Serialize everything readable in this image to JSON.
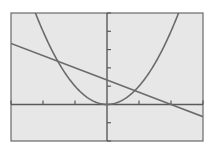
{
  "chart_data": {
    "type": "line",
    "title": "",
    "xlabel": "",
    "ylabel": "",
    "xlim": [
      -3,
      3
    ],
    "ylim": [
      -2,
      5
    ],
    "xscale_ticks": 1,
    "yscale_ticks": 1,
    "grid": false,
    "legend": "none",
    "series": [
      {
        "name": "parabola",
        "equation": "y = x^2",
        "x": [
          -3,
          -2.5,
          -2.236,
          -2,
          -1.5,
          -1,
          -0.5,
          0,
          0.5,
          1,
          1.5,
          2,
          2.236,
          2.5,
          3
        ],
        "values": [
          9,
          6.25,
          5,
          4,
          2.25,
          1,
          0.25,
          0,
          0.25,
          1,
          2.25,
          4,
          5,
          6.25,
          9
        ]
      },
      {
        "name": "line",
        "equation": "y = -(2/3)x + 4/3",
        "x": [
          -3,
          0,
          2,
          3
        ],
        "values": [
          3.333,
          1.333,
          0,
          -0.667
        ]
      }
    ],
    "intersections": [
      {
        "x": -1.535,
        "y": 2.357
      },
      {
        "x": 0.869,
        "y": 0.754
      }
    ]
  },
  "colors": {
    "background": "#e7e7e7",
    "curve": "#6b6b6b",
    "axis": "#5a5a5a"
  }
}
